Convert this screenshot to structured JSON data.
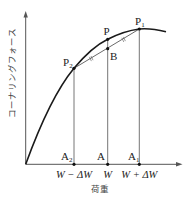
{
  "diagram": {
    "type": "cornering-force-vs-load-curve",
    "axes": {
      "x_label": "荷重",
      "y_label": "コーナリングフォース"
    },
    "points": {
      "P": {
        "label": "P",
        "sub": ""
      },
      "P1": {
        "label": "P",
        "sub": "1"
      },
      "P2": {
        "label": "P",
        "sub": "2"
      },
      "B": {
        "label": "B",
        "sub": ""
      },
      "A": {
        "label": "A",
        "sub": ""
      },
      "A1": {
        "label": "A",
        "sub": "1"
      },
      "A2": {
        "label": "A",
        "sub": "2"
      }
    },
    "x_ticks": [
      {
        "id": "A2",
        "label": "W − ΔW"
      },
      {
        "id": "A",
        "label": "W"
      },
      {
        "id": "A1",
        "label": "W + ΔW"
      }
    ],
    "annotations": {
      "equal_segments_marker": "//",
      "description": "P2B = BP1 (B is midpoint of chord P2P1)"
    },
    "colors": {
      "curve": "#1a1a1a",
      "axis": "#555555",
      "guide_lines": "#666666",
      "background": "#ffffff"
    }
  }
}
